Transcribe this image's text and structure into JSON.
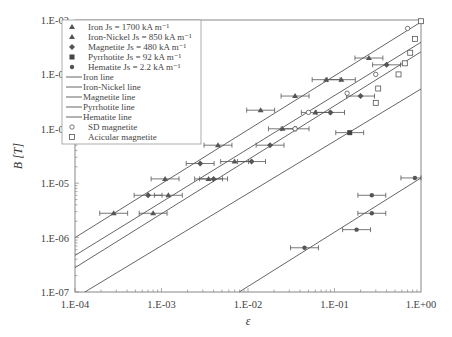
{
  "chart_data": {
    "type": "scatter",
    "title": "",
    "xlabel": "ε",
    "ylabel": "B [T]",
    "xscale": "log",
    "yscale": "log",
    "xlim": [
      0.0001,
      1
    ],
    "ylim": [
      1e-07,
      0.01
    ],
    "grid": false,
    "legend_position": "upper left",
    "x_ticks": [
      "1.E-04",
      "1.E-03",
      "1.E-02",
      "1.E-01",
      "1.E+00"
    ],
    "y_ticks": [
      "1.E-02",
      "1.E-03",
      "1.E-04",
      "1.E-05",
      "1.E-06",
      "1.E-07"
    ],
    "legend": [
      {
        "label": "Iron Js = 1700 kA m⁻¹",
        "marker": "triangle"
      },
      {
        "label": "Iron-Nickel Js = 850 kA m⁻¹",
        "marker": "triangle"
      },
      {
        "label": "Magnetite Js = 480 kA m⁻¹",
        "marker": "diamond"
      },
      {
        "label": "Pyrrhotite Js = 92 kA m⁻¹",
        "marker": "square-filled"
      },
      {
        "label": "Hematite Js = 2.2 kA m⁻¹",
        "marker": "circle-filled"
      },
      {
        "label": "Iron line",
        "marker": "line"
      },
      {
        "label": "Iron-Nickel line",
        "marker": "line"
      },
      {
        "label": "Magnetite line",
        "marker": "line"
      },
      {
        "label": "Pyrrhotite line",
        "marker": "line"
      },
      {
        "label": "Hematite line",
        "marker": "line"
      },
      {
        "label": "SD magnetite",
        "marker": "circle-open"
      },
      {
        "label": "Acicular magnetite",
        "marker": "square-open"
      }
    ],
    "lines": [
      {
        "name": "Iron line",
        "x": [
          0.0001,
          1
        ],
        "y": [
          1e-06,
          0.0092
        ]
      },
      {
        "name": "Iron-Nickel line",
        "x": [
          0.0001,
          1
        ],
        "y": [
          4.7e-07,
          0.0039
        ]
      },
      {
        "name": "Magnetite line",
        "x": [
          0.0001,
          1
        ],
        "y": [
          2.8e-07,
          0.0026
        ]
      },
      {
        "name": "Pyrrhotite line",
        "x": [
          0.00013,
          1
        ],
        "y": [
          1e-07,
          0.00054
        ]
      },
      {
        "name": "Hematite line",
        "x": [
          0.0079,
          1
        ],
        "y": [
          1e-07,
          1.25e-05
        ]
      }
    ],
    "series": [
      {
        "name": "Iron",
        "marker": "triangle",
        "points": [
          [
            0.00028,
            2.8e-06
          ],
          [
            0.0011,
            1.2e-05
          ],
          [
            0.0045,
            5e-05
          ],
          [
            0.014,
            0.00022
          ],
          [
            0.035,
            0.0004
          ],
          [
            0.08,
            0.0008
          ],
          [
            0.25,
            0.002
          ]
        ]
      },
      {
        "name": "Iron-Nickel",
        "marker": "triangle",
        "points": [
          [
            0.0008,
            2.8e-06
          ],
          [
            0.0012,
            6e-06
          ],
          [
            0.0035,
            1.2e-05
          ],
          [
            0.007,
            2.5e-05
          ],
          [
            0.025,
            0.0001
          ],
          [
            0.06,
            0.0002
          ],
          [
            0.12,
            0.0008
          ]
        ]
      },
      {
        "name": "Magnetite",
        "marker": "diamond",
        "points": [
          [
            0.0007,
            6e-06
          ],
          [
            0.0028,
            2.3e-05
          ],
          [
            0.004,
            1.2e-05
          ],
          [
            0.011,
            2.5e-05
          ],
          [
            0.018,
            5e-05
          ],
          [
            0.035,
            0.0001
          ],
          [
            0.09,
            0.0002
          ],
          [
            0.2,
            0.0004
          ],
          [
            0.4,
            0.0015
          ]
        ]
      },
      {
        "name": "Pyrrhotite",
        "marker": "square-filled",
        "points": [
          [
            0.15,
            8.5e-05
          ]
        ]
      },
      {
        "name": "Hematite",
        "marker": "circle-filled",
        "points": [
          [
            0.045,
            6.5e-07
          ],
          [
            0.18,
            1.4e-06
          ],
          [
            0.27,
            2.8e-06
          ],
          [
            0.27,
            6e-06
          ],
          [
            0.85,
            1.25e-05
          ]
        ]
      },
      {
        "name": "SD magnetite",
        "marker": "circle-open",
        "points": [
          [
            0.7,
            0.007
          ],
          [
            0.3,
            0.001
          ],
          [
            0.14,
            0.00045
          ],
          [
            0.05,
            0.0002
          ],
          [
            0.035,
            0.0001
          ]
        ]
      },
      {
        "name": "Acicular magnetite",
        "marker": "square-open",
        "points": [
          [
            1.0,
            0.0095
          ],
          [
            0.85,
            0.0045
          ],
          [
            0.75,
            0.0025
          ],
          [
            0.65,
            0.0016
          ],
          [
            0.55,
            0.001
          ],
          [
            0.32,
            0.00055
          ],
          [
            0.3,
            0.0003
          ]
        ]
      }
    ]
  }
}
